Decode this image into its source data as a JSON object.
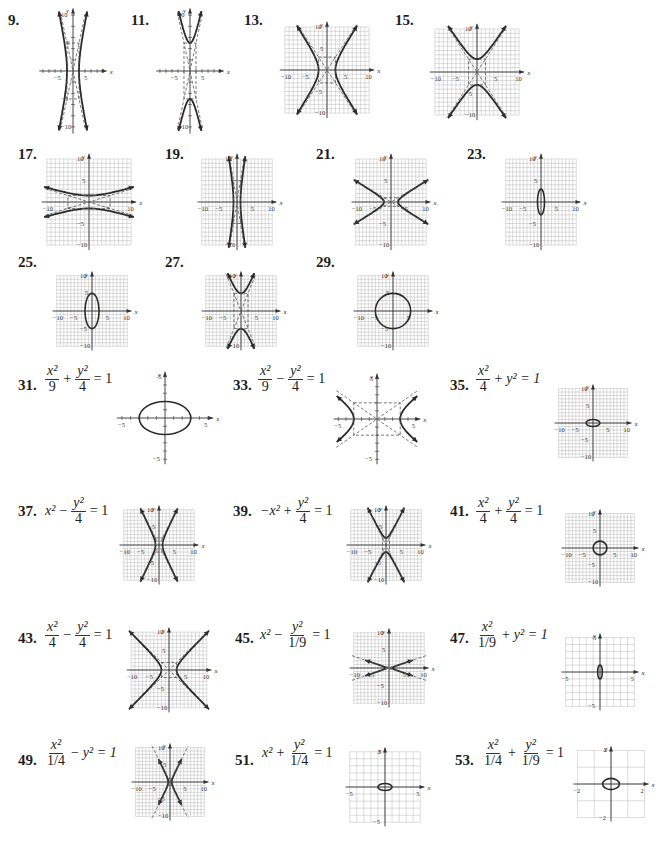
{
  "problems": [
    {
      "num": "9.",
      "type": "hyperbola-x",
      "a": 2,
      "b": 5,
      "range": 10,
      "grid": false,
      "xticks": [
        "-5",
        "5"
      ],
      "yticks": [
        "10",
        "5",
        "-5",
        "-10"
      ],
      "box": [
        -2,
        -5,
        2,
        5
      ],
      "numPos": [
        8,
        12
      ],
      "graph": [
        38,
        6,
        70,
        130
      ]
    },
    {
      "num": "11.",
      "type": "hyperbola-y",
      "a": 2,
      "b": 5,
      "range": 10,
      "grid": false,
      "xticks": [
        "-5",
        "5"
      ],
      "yticks": [
        "10",
        "-10"
      ],
      "box": [
        -2,
        -5,
        2,
        5
      ],
      "numPos": [
        131,
        12
      ],
      "graph": [
        155,
        6,
        70,
        130
      ]
    },
    {
      "num": "13.",
      "type": "hyperbola-x",
      "a": 2,
      "b": 3,
      "range": 10,
      "grid": true,
      "xticks": [
        "-10",
        "-5",
        "5",
        "10"
      ],
      "yticks": [
        "10",
        "5",
        "-5",
        "-10"
      ],
      "box": [
        -2,
        -3,
        2,
        3
      ],
      "numPos": [
        244,
        12
      ],
      "graph": [
        278,
        20,
        98,
        100
      ]
    },
    {
      "num": "15.",
      "type": "hyperbola-y",
      "a": 2,
      "b": 3,
      "range": 10,
      "grid": true,
      "xticks": [
        "-10",
        "-5",
        "5",
        "10"
      ],
      "yticks": [
        "10",
        "-5",
        "-10"
      ],
      "box": [
        -2,
        -3,
        2,
        3
      ],
      "numPos": [
        395,
        12
      ],
      "graph": [
        428,
        22,
        98,
        100
      ]
    },
    {
      "num": "17.",
      "type": "hyperbola-y",
      "a": 5,
      "b": 1.5,
      "range": 10,
      "grid": true,
      "xticks": [
        "-10",
        "-5",
        "5",
        "10"
      ],
      "yticks": [
        "10",
        "5",
        "-5",
        "-10"
      ],
      "box": [
        -5,
        -1.5,
        5,
        1.5
      ],
      "numPos": [
        18,
        146
      ],
      "graph": [
        40,
        152,
        98,
        100
      ]
    },
    {
      "num": "19.",
      "type": "hyperbola-x",
      "a": 1,
      "b": 5,
      "range": 10,
      "grid": true,
      "xticks": [
        "-10",
        "-5",
        "5",
        "10"
      ],
      "yticks": [
        "10",
        "-10"
      ],
      "box": [
        -1,
        -5,
        1,
        5
      ],
      "numPos": [
        165,
        146
      ],
      "graph": [
        196,
        152,
        82,
        100
      ]
    },
    {
      "num": "21.",
      "type": "hyperbola-x",
      "a": 2,
      "b": 1,
      "range": 10,
      "grid": true,
      "xticks": [
        "-10",
        "-5",
        "5",
        "10"
      ],
      "yticks": [
        "10",
        "5",
        "-5",
        "-10"
      ],
      "box": [
        -2,
        -1,
        2,
        1
      ],
      "numPos": [
        316,
        146
      ],
      "graph": [
        350,
        152,
        82,
        100
      ]
    },
    {
      "num": "23.",
      "type": "ellipse",
      "a": 1,
      "b": 3,
      "range": 10,
      "grid": true,
      "xticks": [
        "-10",
        "-5",
        "5",
        "10"
      ],
      "yticks": [
        "10",
        "5",
        "-5",
        "-10"
      ],
      "numPos": [
        467,
        146
      ],
      "graph": [
        500,
        152,
        82,
        100
      ]
    },
    {
      "num": "25.",
      "type": "ellipse",
      "a": 2,
      "b": 5,
      "range": 10,
      "grid": true,
      "xticks": [
        "-10",
        "-5",
        "5",
        "10"
      ],
      "yticks": [
        "10",
        "5",
        "-5",
        "-10"
      ],
      "numPos": [
        18,
        254
      ],
      "graph": [
        51,
        270,
        82,
        82
      ]
    },
    {
      "num": "27.",
      "type": "hyperbola-y",
      "a": 2,
      "b": 5,
      "range": 10,
      "grid": true,
      "xticks": [
        "-10",
        "-5",
        "5",
        "10"
      ],
      "yticks": [
        "10",
        "-10"
      ],
      "box": [
        -2,
        -5,
        2,
        5
      ],
      "numPos": [
        165,
        254
      ],
      "graph": [
        200,
        270,
        82,
        82
      ]
    },
    {
      "num": "29.",
      "type": "ellipse",
      "a": 5,
      "b": 5,
      "range": 10,
      "grid": true,
      "xticks": [
        "-10",
        "-5",
        "5"
      ],
      "yticks": [
        "10",
        "5",
        "-5",
        "-10"
      ],
      "numPos": [
        316,
        254
      ],
      "graph": [
        352,
        270,
        82,
        82
      ]
    }
  ],
  "equation_problems": [
    {
      "num": "31.",
      "eq": [
        {
          "frac": [
            "x²",
            "9"
          ]
        },
        {
          "op": "+"
        },
        {
          "frac": [
            "y²",
            "4"
          ]
        },
        {
          "op": "= 1"
        }
      ],
      "type": "ellipse",
      "a": 3,
      "b": 2,
      "range": 5,
      "grid": false,
      "xticks": [
        "-5",
        "5"
      ],
      "yticks": [
        "5",
        "-5"
      ],
      "numPos": [
        18,
        377
      ],
      "eqPos": [
        45,
        364
      ],
      "graph": [
        115,
        370,
        100,
        96
      ]
    },
    {
      "num": "33.",
      "eq": [
        {
          "frac": [
            "x²",
            "9"
          ]
        },
        {
          "op": "−"
        },
        {
          "frac": [
            "y²",
            "4"
          ]
        },
        {
          "op": "= 1"
        }
      ],
      "type": "hyperbola-x",
      "a": 3,
      "b": 2,
      "range": 5,
      "grid": false,
      "xticks": [
        "-5",
        "5"
      ],
      "yticks": [
        "5",
        "-5"
      ],
      "box": [
        -3,
        -2,
        3,
        2
      ],
      "numPos": [
        233,
        377
      ],
      "eqPos": [
        258,
        364
      ],
      "graph": [
        332,
        372,
        90,
        94
      ]
    },
    {
      "num": "35.",
      "eq": [
        {
          "frac": [
            "x²",
            "4"
          ]
        },
        {
          "op": "+"
        },
        {
          "t": "y² = 1"
        }
      ],
      "type": "ellipse",
      "a": 2,
      "b": 1,
      "range": 10,
      "grid": true,
      "xticks": [
        "-10",
        "-5",
        "5",
        "10"
      ],
      "yticks": [
        "10",
        "5",
        "-5",
        "-10"
      ],
      "numPos": [
        450,
        377
      ],
      "eqPos": [
        476,
        364
      ],
      "graph": [
        553,
        383,
        80,
        80
      ]
    },
    {
      "num": "37.",
      "eq": [
        {
          "t": "x²"
        },
        {
          "op": "−"
        },
        {
          "frac": [
            "y²",
            "4"
          ]
        },
        {
          "op": "= 1"
        }
      ],
      "type": "hyperbola-x",
      "a": 1,
      "b": 2,
      "range": 10,
      "grid": true,
      "xticks": [
        "-10",
        "-5",
        "5",
        "10"
      ],
      "yticks": [
        "10",
        "5",
        "-5",
        "-10"
      ],
      "box": [
        -1,
        -2,
        1,
        2
      ],
      "numPos": [
        18,
        503
      ],
      "eqPos": [
        45,
        496
      ],
      "graph": [
        118,
        504,
        82,
        82
      ]
    },
    {
      "num": "39.",
      "eq": [
        {
          "t": "−x²"
        },
        {
          "op": "+"
        },
        {
          "frac": [
            "y²",
            "4"
          ]
        },
        {
          "op": "= 1"
        }
      ],
      "type": "hyperbola-y",
      "a": 1,
      "b": 2,
      "range": 10,
      "grid": true,
      "xticks": [
        "-10",
        "-5",
        "5",
        "10"
      ],
      "yticks": [
        "10",
        "5",
        "-5",
        "-10"
      ],
      "box": [
        -1,
        -2,
        1,
        2
      ],
      "numPos": [
        233,
        503
      ],
      "eqPos": [
        260,
        496
      ],
      "graph": [
        345,
        504,
        82,
        82
      ]
    },
    {
      "num": "41.",
      "eq": [
        {
          "frac": [
            "x²",
            "4"
          ]
        },
        {
          "op": "+"
        },
        {
          "frac": [
            "y²",
            "4"
          ]
        },
        {
          "op": "= 1"
        }
      ],
      "type": "ellipse",
      "a": 2,
      "b": 2,
      "range": 10,
      "grid": true,
      "xticks": [
        "-10",
        "-5",
        "5",
        "10"
      ],
      "yticks": [
        "10",
        "5",
        "-5",
        "-10"
      ],
      "numPos": [
        450,
        503
      ],
      "eqPos": [
        476,
        496
      ],
      "graph": [
        560,
        508,
        80,
        80
      ]
    },
    {
      "num": "43.",
      "eq": [
        {
          "frac": [
            "x²",
            "4"
          ]
        },
        {
          "op": "−"
        },
        {
          "frac": [
            "y²",
            "4"
          ]
        },
        {
          "op": "= 1"
        }
      ],
      "type": "hyperbola-x",
      "a": 2,
      "b": 2,
      "range": 10,
      "grid": true,
      "xticks": [
        "-10",
        "-5",
        "5",
        "10"
      ],
      "yticks": [
        "10",
        "5",
        "-5",
        "-10"
      ],
      "box": [
        -2,
        -2,
        2,
        2
      ],
      "numPos": [
        18,
        630
      ],
      "eqPos": [
        45,
        620
      ],
      "graph": [
        125,
        626,
        88,
        88
      ]
    },
    {
      "num": "45.",
      "eq": [
        {
          "t": "x²"
        },
        {
          "op": "−"
        },
        {
          "frac": [
            "y²",
            "1/9"
          ]
        },
        {
          "op": "= 1"
        }
      ],
      "type": "hyperbola-x",
      "a": 1,
      "b": 0.333,
      "range": 10,
      "grid": true,
      "xticks": [
        "-10",
        "-5",
        "5",
        "10"
      ],
      "yticks": [
        "10",
        "5",
        "-5",
        "-10"
      ],
      "box": [
        -1,
        -0.333,
        1,
        0.333
      ],
      "numPos": [
        235,
        630
      ],
      "eqPos": [
        260,
        620
      ],
      "graph": [
        348,
        627,
        82,
        82
      ]
    },
    {
      "num": "47.",
      "eq": [
        {
          "frac": [
            "x²",
            "1/9"
          ]
        },
        {
          "op": "+"
        },
        {
          "t": "y² = 1"
        }
      ],
      "type": "ellipse",
      "a": 0.333,
      "b": 1,
      "range": 5,
      "grid": true,
      "gridStep": 1,
      "xticks": [
        "-5",
        "5"
      ],
      "yticks": [
        "5",
        "-5"
      ],
      "numPos": [
        450,
        630
      ],
      "eqPos": [
        476,
        620
      ],
      "graph": [
        560,
        632,
        80,
        80
      ]
    },
    {
      "num": "49.",
      "eq": [
        {
          "frac": [
            "x²",
            "1/4"
          ]
        },
        {
          "op": "−"
        },
        {
          "t": "y² = 1"
        }
      ],
      "type": "hyperbola-x",
      "a": 0.5,
      "b": 1,
      "range": 10,
      "grid": true,
      "xticks": [
        "-10",
        "-5",
        "5",
        "10"
      ],
      "yticks": [
        "10",
        "5",
        "-5",
        "-10"
      ],
      "box": [
        -0.5,
        -1,
        0.5,
        1
      ],
      "numPos": [
        18,
        752
      ],
      "eqPos": [
        45,
        738
      ],
      "graph": [
        130,
        742,
        80,
        80
      ]
    },
    {
      "num": "51.",
      "eq": [
        {
          "t": "x²"
        },
        {
          "op": "+"
        },
        {
          "frac": [
            "y²",
            "1/4"
          ]
        },
        {
          "op": "= 1"
        }
      ],
      "type": "ellipse",
      "a": 1,
      "b": 0.5,
      "range": 5,
      "grid": true,
      "gridStep": 1,
      "xticks": [
        "-5",
        "5"
      ],
      "yticks": [
        "5",
        "-5"
      ],
      "numPos": [
        235,
        752
      ],
      "eqPos": [
        262,
        738
      ],
      "graph": [
        344,
        746,
        82,
        82
      ]
    },
    {
      "num": "53.",
      "eq": [
        {
          "frac": [
            "x²",
            "1/4"
          ]
        },
        {
          "op": "+"
        },
        {
          "frac": [
            "y²",
            "1/9"
          ]
        },
        {
          "op": "= 1"
        }
      ],
      "type": "ellipse",
      "a": 0.5,
      "b": 0.333,
      "range": 2,
      "grid": true,
      "gridStep": 1,
      "xticks": [
        "-2",
        "2"
      ],
      "yticks": [
        "2",
        "-2"
      ],
      "numPos": [
        455,
        752
      ],
      "eqPos": [
        482,
        738
      ],
      "graph": [
        572,
        745,
        78,
        78
      ]
    }
  ],
  "labels": {
    "xaxis": "x",
    "yaxis": "y"
  },
  "colors": {
    "curve": "#2a2a2a",
    "grid": "#b8b8b8",
    "axis": "#333333",
    "asymptote": "#555555"
  }
}
